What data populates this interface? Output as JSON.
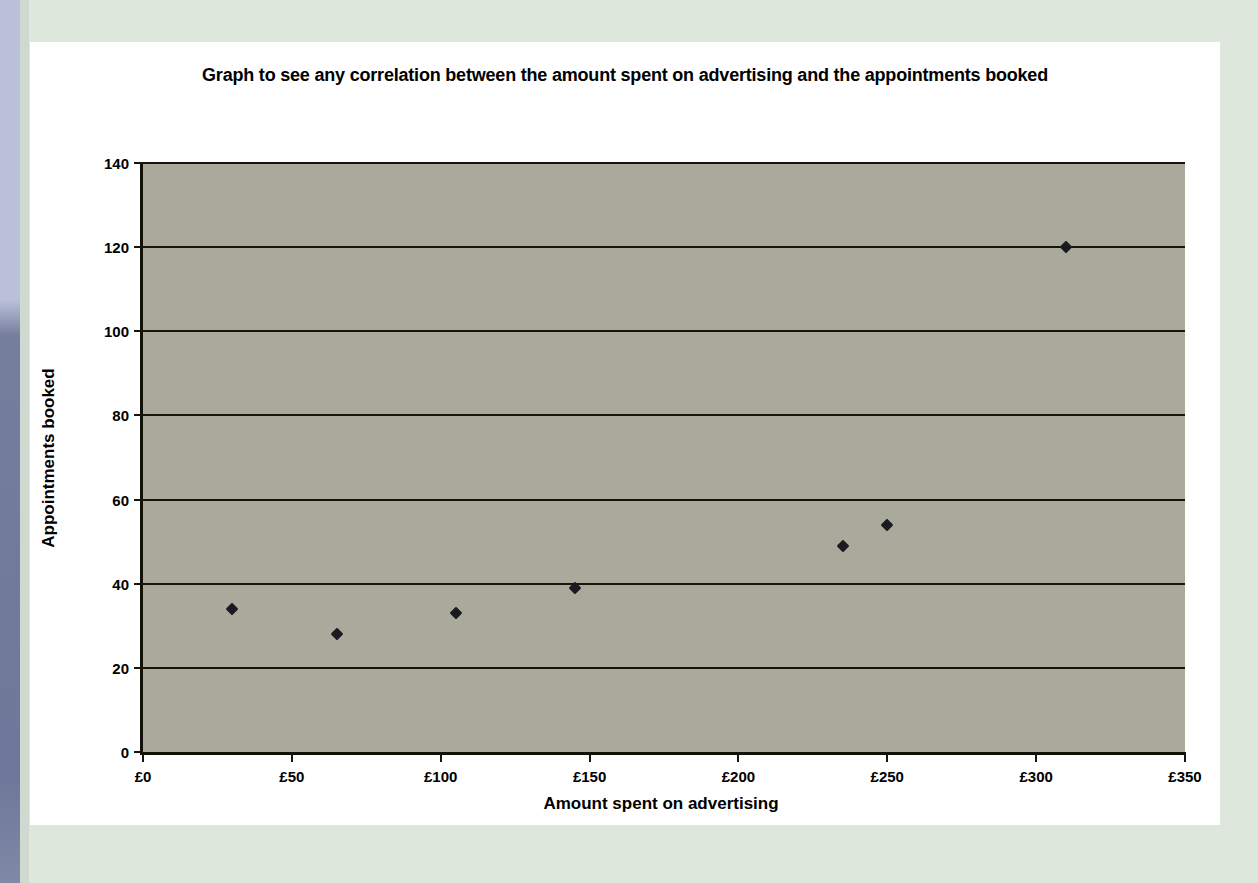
{
  "chart_data": {
    "type": "scatter",
    "title": "Graph to see any correlation between the amount spent on advertising and the appointments booked",
    "xlabel": "Amount spent on advertising",
    "ylabel": "Appointments booked",
    "xlim": [
      0,
      350
    ],
    "ylim": [
      0,
      140
    ],
    "xticks": [
      0,
      50,
      100,
      150,
      200,
      250,
      300,
      350
    ],
    "xtick_labels": [
      "£0",
      "£50",
      "£100",
      "£150",
      "£200",
      "£250",
      "£300",
      "£350"
    ],
    "yticks": [
      0,
      20,
      40,
      60,
      80,
      100,
      120,
      140
    ],
    "ytick_labels": [
      "0",
      "20",
      "40",
      "60",
      "80",
      "100",
      "120",
      "140"
    ],
    "grid": "horizontal",
    "legend": "none",
    "marker": "diamond",
    "marker_color": "#1a1a20",
    "plot_background": "#a9aa9b",
    "axis_color": "#15150c",
    "points": [
      {
        "x": 30,
        "y": 34
      },
      {
        "x": 65,
        "y": 28
      },
      {
        "x": 105,
        "y": 33
      },
      {
        "x": 145,
        "y": 39
      },
      {
        "x": 235,
        "y": 49
      },
      {
        "x": 250,
        "y": 54
      },
      {
        "x": 310,
        "y": 120
      }
    ]
  },
  "page": {
    "background_color": "#dde7dc",
    "card_color": "#ffffff",
    "edge_strip_color": "#767e9e"
  }
}
